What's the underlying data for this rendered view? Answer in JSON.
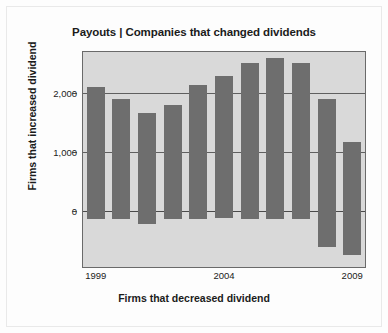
{
  "figure": {
    "background_color": "#fdfdfd",
    "plot_background_color": "#d9d9d9",
    "bar_color": "#6e6e6e",
    "grid_color": "#5f5f5f",
    "text_color": "#1b1b1b"
  },
  "chart_data": {
    "type": "bar",
    "title": "Payouts | Companies that changed dividends",
    "xlabel": "Firms that decreased dividend",
    "ylabel": "Firms that increased dividend",
    "grid": true,
    "legend": "none",
    "categories": [
      1999,
      2000,
      2001,
      2002,
      2003,
      2004,
      2005,
      2006,
      2007,
      2008,
      2009
    ],
    "xtick_labels": [
      "1999",
      "2004",
      "2009"
    ],
    "xtick_categories": [
      1999,
      2004,
      2009
    ],
    "ytick_labels": [
      "2,000",
      "1,000",
      "0"
    ],
    "ytick_values": [
      2000,
      1000,
      0
    ],
    "ylim": [
      -960,
      2700
    ],
    "series": [
      {
        "name": "Firms that increased dividend",
        "values": [
          2100,
          1900,
          1670,
          1790,
          2140,
          2290,
          2520,
          2590,
          2520,
          1900,
          1170
        ]
      },
      {
        "name": "Firms that decreased dividend",
        "values": [
          -140,
          -150,
          -230,
          -145,
          -140,
          -125,
          -145,
          -140,
          -145,
          -620,
          -760
        ]
      }
    ]
  }
}
